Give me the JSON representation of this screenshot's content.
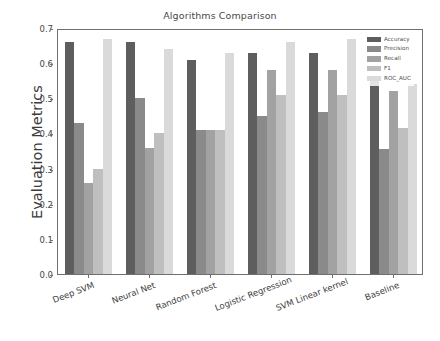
{
  "chart_data": {
    "type": "bar",
    "title": "Algorithms Comparison",
    "xlabel": "",
    "ylabel": "Evaluation Metrics",
    "ylim": [
      0.0,
      0.7
    ],
    "yticks": [
      "0.0",
      "0.1",
      "0.2",
      "0.3",
      "0.4",
      "0.5",
      "0.6",
      "0.7"
    ],
    "ytick_values": [
      0.0,
      0.1,
      0.2,
      0.3,
      0.4,
      0.5,
      0.6,
      0.7
    ],
    "grid": false,
    "legend_position": "upper right",
    "xtick_rotation": -21,
    "categories": [
      "Deep SVM",
      "Neural Net",
      "Random Forest",
      "Logistic Regression",
      "SVM Linear kernel",
      "Baseline"
    ],
    "series": [
      {
        "name": "Accuracy",
        "color": "#5e5e5e",
        "values": [
          0.66,
          0.66,
          0.61,
          0.63,
          0.63,
          0.55
        ]
      },
      {
        "name": "Precision",
        "color": "#8a8a8a",
        "values": [
          0.43,
          0.5,
          0.41,
          0.45,
          0.46,
          0.355
        ]
      },
      {
        "name": "Recall",
        "color": "#a2a2a2",
        "values": [
          0.26,
          0.36,
          0.41,
          0.58,
          0.58,
          0.52
        ]
      },
      {
        "name": "F1",
        "color": "#bfbfbf",
        "values": [
          0.3,
          0.4,
          0.41,
          0.51,
          0.51,
          0.415
        ]
      },
      {
        "name": "ROC_AUC",
        "color": "#dadada",
        "values": [
          0.67,
          0.64,
          0.63,
          0.66,
          0.67,
          0.54
        ]
      }
    ]
  },
  "legend": {
    "entries": [
      "Accuracy",
      "Precision",
      "Recall",
      "F1",
      "ROC_AUC"
    ]
  },
  "axes": {
    "frame_color": "#6f6f6f",
    "background": "#ffffff"
  }
}
